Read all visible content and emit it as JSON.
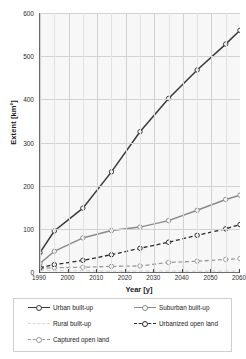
{
  "chart_data": {
    "type": "line",
    "title": "",
    "xlabel": "Year [y]",
    "ylabel": "Extent [km²]",
    "xlim": [
      1990,
      2060
    ],
    "ylim": [
      0,
      600
    ],
    "xticks": [
      1990,
      2000,
      2010,
      2020,
      2030,
      2040,
      2050,
      2060
    ],
    "yticks": [
      0,
      100,
      200,
      300,
      400,
      500,
      600
    ],
    "grid": true,
    "legend_position": "below",
    "x": [
      1990,
      1995,
      2005,
      2015,
      2025,
      2035,
      2045,
      2055,
      2060
    ],
    "series": [
      {
        "name": "Urban built-up",
        "color": "#3a3a3a",
        "style": "solid",
        "marker": "open-circle",
        "values": [
          45,
          95,
          148,
          232,
          325,
          402,
          468,
          528,
          560
        ]
      },
      {
        "name": "Suburban built-up",
        "color": "#8a8a8a",
        "style": "solid",
        "marker": "open-circle",
        "values": [
          20,
          48,
          79,
          96,
          104,
          119,
          143,
          168,
          178
        ]
      },
      {
        "name": "Urbanized open land",
        "color": "#2b2b2b",
        "style": "dashed",
        "marker": "open-circle",
        "values": [
          10,
          17,
          27,
          40,
          55,
          69,
          85,
          100,
          110
        ]
      },
      {
        "name": "Captured open land",
        "color": "#9a9a9a",
        "style": "dashed",
        "marker": "open-circle",
        "values": [
          8,
          10,
          11,
          13,
          14,
          22,
          25,
          29,
          31
        ]
      },
      {
        "name": "Rural built-up",
        "color": "#d8d8d8",
        "style": "dashed",
        "marker": "none",
        "values": [
          4,
          3,
          3,
          2,
          2,
          2,
          2,
          2,
          2
        ]
      }
    ]
  },
  "legend": {
    "entries": [
      {
        "label": "Urban built-up"
      },
      {
        "label": "Suburban built-up"
      },
      {
        "label": "Rural built-up"
      },
      {
        "label": "Urbanized open land"
      },
      {
        "label": "Captured open land"
      }
    ]
  }
}
